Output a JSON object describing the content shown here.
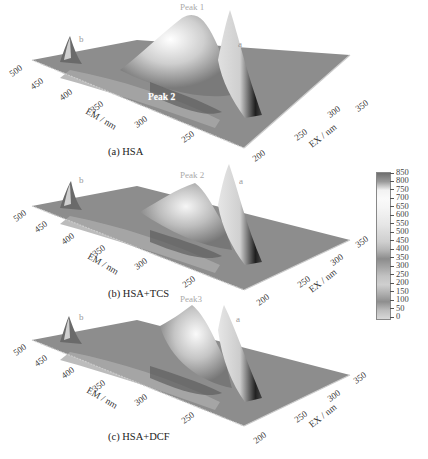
{
  "figure": {
    "panels": [
      {
        "id": "a",
        "caption": "(a) HSA",
        "peak_labels": {
          "main": "Peak 1",
          "secondary": "Peak 2",
          "scatter_a": "a",
          "scatter_b": "b"
        }
      },
      {
        "id": "b",
        "caption": "(b) HSA+TCS",
        "peak_labels": {
          "main": "Peak 2",
          "scatter_a": "a",
          "scatter_b": "b"
        }
      },
      {
        "id": "c",
        "caption": "(c) HSA+DCF",
        "peak_labels": {
          "main": "Peak3",
          "scatter_a": "a",
          "scatter_b": "b"
        }
      }
    ],
    "axes": {
      "em_label": "EM / nm",
      "ex_label": "EX / nm",
      "em_ticks": [
        "500",
        "450",
        "400",
        "350",
        "300",
        "250"
      ],
      "ex_ticks": [
        "200",
        "250",
        "300",
        "350"
      ]
    },
    "colorbar": {
      "ticks": [
        "850",
        "800",
        "750",
        "700",
        "650",
        "600",
        "550",
        "500",
        "450",
        "400",
        "350",
        "300",
        "250",
        "200",
        "150",
        "100",
        "50",
        "0"
      ],
      "colors": [
        "#6e6e6e",
        "#9a9a9a",
        "#f2f2f2",
        "#fafafa",
        "#f5f5f5",
        "#eeeeee",
        "#e6e6e6",
        "#dadada",
        "#cfcfcf",
        "#b5b5b5",
        "#8c8c8c",
        "#a6a6a6",
        "#c2c2c2",
        "#cfcfcf",
        "#b0b0b0",
        "#8e8e8e",
        "#bdbdbd",
        "#d8d8d8"
      ]
    }
  },
  "chart_data": [
    {
      "type": "surface",
      "title": "(a) HSA",
      "xlabel": "EX / nm",
      "ylabel": "EM / nm",
      "zlabel": "Fluorescence intensity",
      "x_ticks": [
        200,
        250,
        300,
        350
      ],
      "y_ticks": [
        500,
        450,
        400,
        350,
        300,
        250
      ],
      "zlim": [
        0,
        850
      ],
      "annotations": [
        "Peak 1",
        "Peak 2",
        "a",
        "b"
      ],
      "peaks": [
        {
          "name": "Peak 1",
          "ex": 280,
          "em": 340,
          "intensity": 820
        },
        {
          "name": "Peak 2",
          "ex": 230,
          "em": 330,
          "intensity": 450
        },
        {
          "name": "a (Rayleigh scatter)",
          "ex": 250,
          "em": 250,
          "intensity": 750
        },
        {
          "name": "b (2nd-order scatter)",
          "ex": 230,
          "em": 460,
          "intensity": 300
        }
      ]
    },
    {
      "type": "surface",
      "title": "(b) HSA+TCS",
      "xlabel": "EX / nm",
      "ylabel": "EM / nm",
      "zlabel": "Fluorescence intensity",
      "x_ticks": [
        200,
        250,
        300,
        350
      ],
      "y_ticks": [
        500,
        450,
        400,
        350,
        300,
        250
      ],
      "zlim": [
        0,
        850
      ],
      "annotations": [
        "Peak 2",
        "a",
        "b"
      ],
      "peaks": [
        {
          "name": "Peak 2",
          "ex": 280,
          "em": 340,
          "intensity": 620
        },
        {
          "name": "a (Rayleigh scatter)",
          "ex": 250,
          "em": 250,
          "intensity": 780
        },
        {
          "name": "b (2nd-order scatter)",
          "ex": 230,
          "em": 460,
          "intensity": 300
        }
      ]
    },
    {
      "type": "surface",
      "title": "(c) HSA+DCF",
      "xlabel": "EX / nm",
      "ylabel": "EM / nm",
      "zlabel": "Fluorescence intensity",
      "x_ticks": [
        200,
        250,
        300,
        350
      ],
      "y_ticks": [
        500,
        450,
        400,
        350,
        300,
        250
      ],
      "zlim": [
        0,
        850
      ],
      "annotations": [
        "Peak3",
        "a",
        "b"
      ],
      "peaks": [
        {
          "name": "Peak3",
          "ex": 280,
          "em": 340,
          "intensity": 760
        },
        {
          "name": "a (Rayleigh scatter)",
          "ex": 250,
          "em": 250,
          "intensity": 760
        },
        {
          "name": "b (2nd-order scatter)",
          "ex": 230,
          "em": 460,
          "intensity": 300
        }
      ]
    }
  ]
}
